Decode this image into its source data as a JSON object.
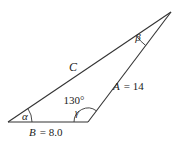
{
  "figure": {
    "type": "triangle-diagram",
    "angles": {
      "alpha_symbol": "α",
      "beta_symbol": "β",
      "gamma_symbol": "γ",
      "gamma_value": "130°"
    },
    "sides": {
      "c_label": "C",
      "a_var": "A",
      "a_eq": "= 14",
      "b_var": "B",
      "b_eq": "= 8.0"
    },
    "colors": {
      "line": "#333333",
      "text": "#222222",
      "background": "#ffffff"
    }
  }
}
